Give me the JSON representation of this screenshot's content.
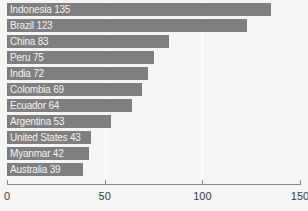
{
  "chart_data": {
    "type": "bar",
    "orientation": "horizontal",
    "title": "",
    "xlabel": "",
    "ylabel": "",
    "xlim": [
      0,
      150
    ],
    "grid": true,
    "legend": null,
    "xticks": [
      "0",
      "50",
      "100",
      "150"
    ],
    "xtick_values": [
      0,
      50,
      100,
      150
    ],
    "categories": [
      "Indonesia",
      "Brazil",
      "China",
      "Peru",
      "India",
      "Colombia",
      "Ecuador",
      "Argentina",
      "United States",
      "Myanmar",
      "Australia"
    ],
    "values": [
      135,
      123,
      83,
      75,
      72,
      69,
      64,
      53,
      43,
      42,
      39
    ],
    "bar_labels": [
      "Indonesia 135",
      "Brazil 123",
      "China 83",
      "Peru 75",
      "India 72",
      "Colombia 69",
      "Ecuador 64",
      "Argentina 53",
      "United States 43",
      "Myanmar 42",
      "Australia 39"
    ],
    "colors": {
      "bar": "#7f7f7f",
      "background": "#f5f5f3",
      "bar_label_text": "#f2f2f0",
      "tick_text": "#3c3c3c",
      "axis_line": "#8a8a8a",
      "gridline": "#ffffff"
    }
  }
}
